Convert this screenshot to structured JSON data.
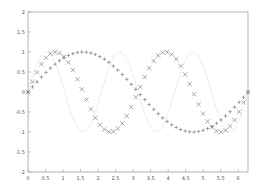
{
  "chart_data": {
    "type": "line",
    "title": "",
    "xlabel": "",
    "ylabel": "",
    "xlim": [
      0,
      6.28
    ],
    "ylim": [
      -2,
      2
    ],
    "x_ticks": [
      "0",
      "0.5",
      "1",
      "1.5",
      "2",
      "2.5",
      "3",
      "3.5",
      "4",
      "4.5",
      "5",
      "5.5",
      "6"
    ],
    "y_ticks": [
      "2",
      "1.5",
      "1",
      "0.5",
      "0",
      "-0.5",
      "-1",
      "-1.5",
      "-2"
    ],
    "grid": false,
    "legend": null,
    "series": [
      {
        "name": "sin(x)",
        "marker": "+",
        "color": "#555555",
        "function": "sin(x)",
        "n_points": 50
      },
      {
        "name": "sin(2x)",
        "marker": "x",
        "color": "#555555",
        "function": "sin(2x)",
        "n_points": 50
      },
      {
        "name": "sin(3x)",
        "marker": "none",
        "color": "#e6e6e6",
        "function": "sin(3x)",
        "n_points": 200
      }
    ]
  }
}
